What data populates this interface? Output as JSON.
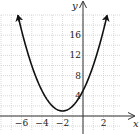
{
  "chart_data": {
    "type": "line",
    "title": "",
    "xlabel": "x",
    "ylabel": "y",
    "function": "y = (x + 2)^2 + 1",
    "vertex": [
      -2,
      1
    ],
    "y_intercept": [
      0,
      5
    ],
    "xlim": [
      -8,
      4
    ],
    "ylim": [
      -2,
      20
    ],
    "x_ticks": [
      -6,
      -4,
      -2,
      2
    ],
    "x_tick_labels": [
      "−6",
      "−4",
      "−2",
      "2"
    ],
    "y_ticks": [
      4,
      8,
      12,
      16
    ],
    "y_tick_labels": [
      "4",
      "8",
      "12",
      "16"
    ],
    "grid": true,
    "grid_x_step": 1,
    "grid_y_step": 2,
    "series": [
      {
        "name": "parabola",
        "x": [
          -6.3,
          -6,
          -5,
          -4,
          -3,
          -2,
          -1,
          0,
          1,
          2,
          2.3
        ],
        "y": [
          19.5,
          17,
          10,
          5,
          2,
          1,
          2,
          5,
          10,
          17,
          19.5
        ]
      }
    ],
    "arrows_on_curve_ends": true,
    "colors": {
      "curve": "#111111",
      "axes": "#333333",
      "grid": "#c8c8c8"
    }
  }
}
